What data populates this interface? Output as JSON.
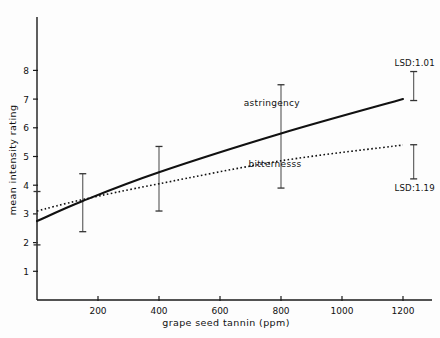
{
  "chart_data": {
    "type": "line",
    "title": "",
    "xlabel": "grape seed tannin (ppm)",
    "ylabel": "mean intensity rating",
    "xlim": [
      0,
      1280
    ],
    "ylim": [
      0,
      8.6
    ],
    "xticks": [
      200,
      400,
      600,
      800,
      1000,
      1200
    ],
    "xtick_labels": [
      "200",
      "400",
      "600",
      "800",
      "1000",
      "1200"
    ],
    "yticks": [
      1,
      2,
      3,
      4,
      5,
      6,
      7,
      8
    ],
    "ytick_labels": [
      "1",
      "2",
      "3",
      "4",
      "5",
      "6",
      "7",
      "8"
    ],
    "grid": false,
    "legend_position": "inline-labels",
    "series": [
      {
        "name": "astringency",
        "style": "solid",
        "label": "astringency",
        "label_x": 770,
        "label_y": 6.75,
        "x": [
          0,
          150,
          400,
          800,
          1200
        ],
        "values": [
          2.75,
          3.45,
          4.45,
          5.8,
          7.0
        ],
        "errorbars": [
          {
            "x": 0,
            "low": 1.92,
            "high": 3.78
          },
          {
            "x": 150,
            "low": 2.38,
            "high": 4.4
          },
          {
            "x": 400,
            "low": 3.1,
            "high": 5.35
          },
          {
            "x": 800,
            "low": 3.9,
            "high": 7.5
          }
        ],
        "lsd_label": "LSD:1.01",
        "lsd_value": 1.01,
        "lsd_x": 1235,
        "lsd_low": 6.95,
        "lsd_high": 7.96
      },
      {
        "name": "bitternesss",
        "style": "dotted",
        "label": "bitternesss",
        "label_x": 780,
        "label_y": 4.62,
        "x": [
          0,
          150,
          400,
          800,
          1200
        ],
        "values": [
          3.1,
          3.5,
          4.05,
          4.85,
          5.4
        ],
        "errorbars": [],
        "lsd_label": "LSD:1.19",
        "lsd_value": 1.19,
        "lsd_x": 1235,
        "lsd_low": 4.22,
        "lsd_high": 5.41
      }
    ]
  }
}
